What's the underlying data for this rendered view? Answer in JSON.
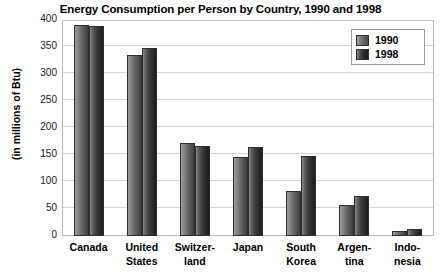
{
  "chart_data": {
    "type": "bar",
    "title": "Energy Consumption per Person by Country, 1990 and 1998",
    "xlabel": "",
    "ylabel": "(in millions of Btu)",
    "ylim": [
      0,
      400
    ],
    "ytick_values": [
      0,
      50,
      100,
      150,
      200,
      250,
      300,
      350,
      400
    ],
    "ytick_labels": [
      "0",
      "50",
      "100",
      "150",
      "200",
      "250",
      "300",
      "350",
      "400"
    ],
    "grid": true,
    "legend_position": "top-right",
    "categories": [
      "Canada",
      "United States",
      "Switzerland",
      "Japan",
      "South Korea",
      "Argentina",
      "Indonesia"
    ],
    "category_lines": [
      [
        "Canada"
      ],
      [
        "United",
        "States"
      ],
      [
        "Switzer-",
        "land"
      ],
      [
        "Japan"
      ],
      [
        "South",
        "Korea"
      ],
      [
        "Argen-",
        "tina"
      ],
      [
        "Indo-",
        "nesia"
      ]
    ],
    "series": [
      {
        "name": "1990",
        "color": "#7a7a7a",
        "values": [
          390,
          335,
          172,
          147,
          83,
          58,
          10
        ]
      },
      {
        "name": "1998",
        "color": "#383838",
        "values": [
          388,
          348,
          167,
          165,
          148,
          75,
          13
        ]
      }
    ]
  },
  "legend": {
    "entries": [
      {
        "label": "1990"
      },
      {
        "label": "1998"
      }
    ]
  }
}
